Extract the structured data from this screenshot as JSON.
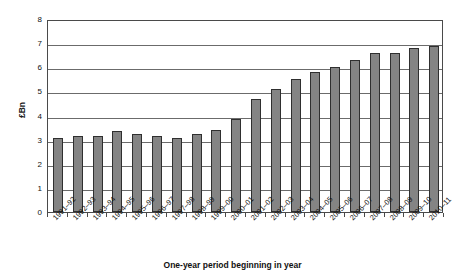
{
  "chart_data": {
    "type": "bar",
    "title": "",
    "subtitle": "",
    "xlabel": "One-year period beginning in year",
    "ylabel": "£Bn",
    "ylim": [
      0,
      8
    ],
    "yticks": [
      "0",
      "1",
      "2",
      "3",
      "4",
      "5",
      "6",
      "7",
      "8"
    ],
    "grid": true,
    "legend": null,
    "legend_position": "none",
    "bar_color": "#848484",
    "bar_border_color": "#2f2f2f",
    "axis_color": "#4a4a4a",
    "gridline_color": "#6b6b6b",
    "categories": [
      "1991–92",
      "1992–93",
      "1993–94",
      "1994–95",
      "1995–96",
      "1996–97",
      "1997–98",
      "1998–99",
      "1999–00",
      "2000–01",
      "2001–02",
      "2002–03",
      "2003–04",
      "2004–05",
      "2005–06",
      "2006–07",
      "2007–08",
      "2008–09",
      "2009–10",
      "2010–11"
    ],
    "values": [
      3.05,
      3.15,
      3.15,
      3.35,
      3.25,
      3.15,
      3.05,
      3.25,
      3.4,
      3.85,
      4.7,
      5.1,
      5.5,
      5.8,
      6.0,
      6.3,
      6.6,
      6.6,
      6.8,
      6.9
    ]
  }
}
